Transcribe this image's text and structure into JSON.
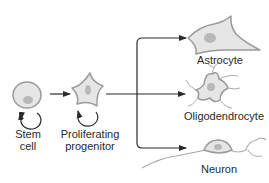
{
  "diagram": {
    "nodes": [
      {
        "id": "stem-cell",
        "label_lines": [
          "Stem",
          "cell"
        ],
        "self_renewing": true
      },
      {
        "id": "proliferating-progenitor",
        "label_lines": [
          "Proliferating",
          "progenitor"
        ],
        "self_renewing": true
      },
      {
        "id": "astrocyte",
        "label_lines": [
          "Astrocyte"
        ]
      },
      {
        "id": "oligodendrocyte",
        "label_lines": [
          "Oligodendrocyte"
        ]
      },
      {
        "id": "neuron",
        "label_lines": [
          "Neuron"
        ]
      }
    ],
    "edges": [
      {
        "from": "stem-cell",
        "to": "proliferating-progenitor"
      },
      {
        "from": "proliferating-progenitor",
        "to": "astrocyte"
      },
      {
        "from": "proliferating-progenitor",
        "to": "oligodendrocyte"
      },
      {
        "from": "proliferating-progenitor",
        "to": "neuron"
      }
    ],
    "colors": {
      "cell_fill": "#e6e6e6",
      "cell_stroke": "#9a9a9a",
      "nucleus": "#b8b8b8",
      "arrow": "#2a2a2a",
      "text": "#2a2a2a"
    }
  }
}
